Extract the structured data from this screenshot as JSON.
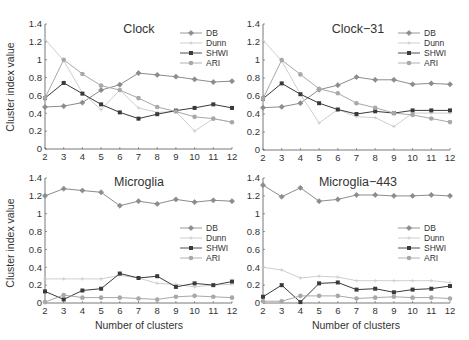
{
  "figure": {
    "ylabel": "Cluster index value",
    "xlabel": "Number of clusters"
  },
  "legend": [
    "DB",
    "Dunn",
    "SHWI",
    "ARI"
  ],
  "colors": {
    "DB": "#8c8c8c",
    "Dunn": "#c8c8c8",
    "SHWI": "#3a3a3a",
    "ARI": "#a8a8a8",
    "axis": "#555555",
    "text": "#333333"
  },
  "chart_data": [
    {
      "type": "line",
      "title": "Clock",
      "xlabel": "",
      "ylabel": "Cluster index value",
      "x": [
        2,
        3,
        4,
        5,
        6,
        7,
        8,
        9,
        10,
        11,
        12
      ],
      "xlim": [
        2,
        12
      ],
      "ylim": [
        0,
        1.4
      ],
      "yticks": [
        0,
        0.2,
        0.4,
        0.6,
        0.8,
        1,
        1.2,
        1.4
      ],
      "grid": false,
      "legend_position": "top-right",
      "series": [
        {
          "name": "DB",
          "values": [
            0.47,
            0.48,
            0.52,
            0.66,
            0.72,
            0.85,
            0.83,
            0.81,
            0.78,
            0.75,
            0.76
          ]
        },
        {
          "name": "Dunn",
          "values": [
            1.23,
            0.99,
            0.63,
            0.44,
            0.66,
            0.46,
            0.41,
            0.42,
            0.2,
            0.34,
            0.3
          ]
        },
        {
          "name": "SHWI",
          "values": [
            0.57,
            0.74,
            0.62,
            0.5,
            0.41,
            0.34,
            0.39,
            0.43,
            0.46,
            0.5,
            0.46
          ]
        },
        {
          "name": "ARI",
          "values": [
            0.57,
            1.0,
            0.84,
            0.71,
            0.66,
            0.57,
            0.47,
            0.42,
            0.36,
            0.34,
            0.3
          ]
        }
      ]
    },
    {
      "type": "line",
      "title": "Clock−31",
      "xlabel": "",
      "ylabel": "",
      "x": [
        2,
        3,
        4,
        5,
        6,
        7,
        8,
        9,
        10,
        11,
        12
      ],
      "xlim": [
        2,
        12
      ],
      "ylim": [
        0,
        1.4
      ],
      "yticks": [
        0,
        0.2,
        0.4,
        0.6,
        0.8,
        1,
        1.2,
        1.4
      ],
      "grid": false,
      "legend_position": "top-right",
      "series": [
        {
          "name": "DB",
          "values": [
            0.47,
            0.48,
            0.52,
            0.67,
            0.72,
            0.81,
            0.78,
            0.78,
            0.73,
            0.74,
            0.73
          ]
        },
        {
          "name": "Dunn",
          "values": [
            1.22,
            0.99,
            0.62,
            0.3,
            0.45,
            0.37,
            0.36,
            0.26,
            0.41,
            0.41,
            0.41
          ]
        },
        {
          "name": "SHWI",
          "values": [
            0.57,
            0.74,
            0.62,
            0.52,
            0.45,
            0.4,
            0.43,
            0.41,
            0.44,
            0.44,
            0.44
          ]
        },
        {
          "name": "ARI",
          "values": [
            0.57,
            1.0,
            0.84,
            0.68,
            0.63,
            0.52,
            0.47,
            0.41,
            0.39,
            0.35,
            0.31
          ]
        }
      ]
    },
    {
      "type": "line",
      "title": "Microglia",
      "xlabel": "Number of clusters",
      "ylabel": "Cluster index value",
      "x": [
        2,
        3,
        4,
        5,
        6,
        7,
        8,
        9,
        10,
        11,
        12
      ],
      "xlim": [
        2,
        12
      ],
      "ylim": [
        0,
        1.4
      ],
      "yticks": [
        0,
        0.2,
        0.4,
        0.6,
        0.8,
        1,
        1.2,
        1.4
      ],
      "grid": false,
      "legend_position": "right",
      "series": [
        {
          "name": "DB",
          "values": [
            1.2,
            1.28,
            1.26,
            1.24,
            1.09,
            1.14,
            1.11,
            1.16,
            1.13,
            1.15,
            1.14
          ]
        },
        {
          "name": "Dunn",
          "values": [
            0.27,
            0.27,
            0.27,
            0.27,
            0.31,
            0.28,
            0.22,
            0.21,
            0.18,
            0.2,
            0.21
          ]
        },
        {
          "name": "SHWI",
          "values": [
            0.13,
            0.04,
            0.14,
            0.16,
            0.33,
            0.28,
            0.3,
            0.18,
            0.22,
            0.2,
            0.24
          ]
        },
        {
          "name": "ARI",
          "values": [
            0.01,
            0.09,
            0.06,
            0.06,
            0.06,
            0.05,
            0.04,
            0.07,
            0.08,
            0.07,
            0.06
          ]
        }
      ]
    },
    {
      "type": "line",
      "title": "Microglia−443",
      "xlabel": "Number of clusters",
      "ylabel": "",
      "x": [
        2,
        3,
        4,
        5,
        6,
        7,
        8,
        9,
        10,
        11,
        12
      ],
      "xlim": [
        2,
        12
      ],
      "ylim": [
        0,
        1.4
      ],
      "yticks": [
        0,
        0.2,
        0.4,
        0.6,
        0.8,
        1,
        1.2,
        1.4
      ],
      "grid": false,
      "legend_position": "right",
      "series": [
        {
          "name": "DB",
          "values": [
            1.32,
            1.19,
            1.29,
            1.14,
            1.16,
            1.21,
            1.21,
            1.2,
            1.2,
            1.21,
            1.2
          ]
        },
        {
          "name": "Dunn",
          "values": [
            0.4,
            0.37,
            0.28,
            0.3,
            0.29,
            0.25,
            0.25,
            0.25,
            0.25,
            0.25,
            0.23
          ]
        },
        {
          "name": "SHWI",
          "values": [
            0.07,
            0.2,
            0.01,
            0.22,
            0.23,
            0.15,
            0.16,
            0.12,
            0.15,
            0.16,
            0.19
          ]
        },
        {
          "name": "ARI",
          "values": [
            0.02,
            0.02,
            0.08,
            0.08,
            0.08,
            0.05,
            0.06,
            0.07,
            0.06,
            0.06,
            0.05
          ]
        }
      ]
    }
  ]
}
